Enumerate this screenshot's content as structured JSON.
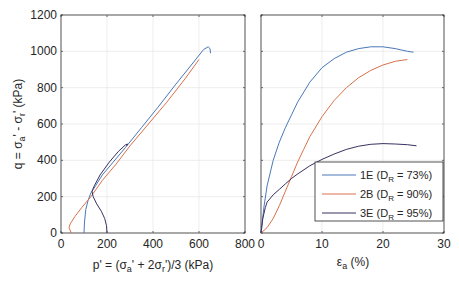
{
  "chart_data": [
    {
      "type": "line",
      "panel": "left",
      "title": "",
      "xlabel": "p' = (σa' + 2σr')/3   (kPa)",
      "ylabel": "q = σa' - σr'   (kPa)",
      "xlim": [
        0,
        800
      ],
      "ylim": [
        0,
        1200
      ],
      "xticks": [
        0,
        200,
        400,
        600,
        800
      ],
      "yticks": [
        0,
        200,
        400,
        600,
        800,
        1000,
        1200
      ],
      "grid": true,
      "series": [
        {
          "name": "1E (DR = 73%)",
          "color": "#4a78b8",
          "x": [
            100,
            102,
            108,
            118,
            130,
            150,
            180,
            220,
            280,
            350,
            420,
            500,
            570,
            620,
            640,
            648,
            650
          ],
          "y": [
            0,
            60,
            130,
            180,
            220,
            260,
            320,
            380,
            470,
            580,
            690,
            820,
            930,
            1010,
            1025,
            1015,
            990
          ]
        },
        {
          "name": "2B (DR = 90%)",
          "color": "#d9714a",
          "x": [
            45,
            35,
            40,
            60,
            90,
            130,
            180,
            240,
            300,
            380,
            460,
            540,
            600
          ],
          "y": [
            0,
            30,
            50,
            90,
            140,
            200,
            290,
            380,
            480,
            600,
            720,
            850,
            955
          ]
        },
        {
          "name": "3E (DR = 95%)",
          "color": "#3a3060",
          "x": [
            200,
            198,
            190,
            175,
            155,
            140,
            135,
            145,
            170,
            210,
            250,
            280,
            290,
            285
          ],
          "y": [
            0,
            40,
            80,
            120,
            160,
            200,
            230,
            260,
            320,
            390,
            450,
            485,
            490,
            480
          ]
        }
      ]
    },
    {
      "type": "line",
      "panel": "right",
      "title": "",
      "xlabel": "εa (%)",
      "ylabel": "",
      "xlim": [
        0,
        30
      ],
      "ylim": [
        0,
        1200
      ],
      "xticks": [
        0,
        10,
        20,
        30
      ],
      "yticks": [
        0,
        200,
        400,
        600,
        800,
        1000,
        1200
      ],
      "grid": true,
      "legend": {
        "position": "lower right",
        "entries": [
          "1E (DR = 73%)",
          "2B (DR = 90%)",
          "3E (DR = 95%)"
        ]
      },
      "series": [
        {
          "name": "1E (DR = 73%)",
          "color": "#4a78b8",
          "x": [
            0,
            0.5,
            1,
            2,
            3,
            4,
            5,
            6,
            8,
            10,
            12,
            14,
            16,
            18,
            20,
            22,
            24,
            25
          ],
          "y": [
            0,
            150,
            260,
            400,
            500,
            580,
            650,
            720,
            830,
            910,
            960,
            995,
            1015,
            1025,
            1025,
            1015,
            1000,
            995
          ]
        },
        {
          "name": "2B (DR = 90%)",
          "color": "#d9714a",
          "x": [
            0,
            1,
            2,
            3,
            4,
            5,
            6,
            7,
            8,
            10,
            12,
            14,
            16,
            18,
            20,
            22,
            24
          ],
          "y": [
            0,
            30,
            80,
            150,
            230,
            310,
            390,
            460,
            530,
            640,
            730,
            800,
            855,
            895,
            925,
            945,
            955
          ]
        },
        {
          "name": "3E (DR = 95%)",
          "color": "#3a3060",
          "x": [
            0,
            0.3,
            0.7,
            1,
            2,
            3,
            4,
            5,
            6,
            8,
            10,
            12,
            14,
            16,
            18,
            20,
            22,
            24,
            25.5
          ],
          "y": [
            0,
            80,
            140,
            170,
            210,
            240,
            270,
            300,
            325,
            370,
            405,
            435,
            460,
            478,
            488,
            492,
            490,
            486,
            480
          ]
        }
      ]
    }
  ],
  "left": {
    "xticks": [
      "0",
      "200",
      "400",
      "600",
      "800"
    ],
    "yticks": [
      "0",
      "200",
      "400",
      "600",
      "800",
      "1000",
      "1200"
    ],
    "xlabel_prefix": "p' = (σ",
    "xlabel_sub_a": "a",
    "xlabel_mid": "' + 2σ",
    "xlabel_sub_r": "r",
    "xlabel_suffix": "')/3   (kPa)",
    "ylabel_prefix": "q = σ",
    "ylabel_sub_a": "a",
    "ylabel_mid": "' - σ",
    "ylabel_sub_r": "r",
    "ylabel_suffix": "'   (kPa)"
  },
  "right": {
    "xticks": [
      "0",
      "10",
      "20",
      "30"
    ],
    "xlabel_eps": "ε",
    "xlabel_sub": "a",
    "xlabel_suffix": " (%)"
  },
  "legend": {
    "items": [
      {
        "id": "1E",
        "pre": "1E (D",
        "sub": "R",
        "post": " = 73%)",
        "color": "#4a78b8"
      },
      {
        "id": "2B",
        "pre": "2B (D",
        "sub": "R",
        "post": " = 90%)",
        "color": "#d9714a"
      },
      {
        "id": "3E",
        "pre": "3E (D",
        "sub": "R",
        "post": " = 95%)",
        "color": "#3a3060"
      }
    ]
  }
}
